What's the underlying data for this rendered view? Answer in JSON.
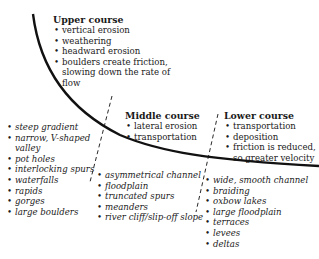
{
  "diagram": {
    "upper_course": {
      "title": "Upper course",
      "processes": [
        "vertical erosion",
        "weathering",
        "headward erosion",
        "boulders create friction, slowing down the rate of flow"
      ],
      "features": [
        "steep gradient",
        "narrow, V-shaped valley",
        "pot holes",
        "interlocking spurs",
        "waterfalls",
        "rapids",
        "gorges",
        "large boulders"
      ]
    },
    "middle_course": {
      "title": "Middle course",
      "processes": [
        "lateral erosion",
        "transportation"
      ],
      "features": [
        "asymmetrical channel",
        "floodplain",
        "truncated spurs",
        "meanders",
        "river cliff/slip-off slope"
      ]
    },
    "lower_course": {
      "title": "Lower course",
      "processes": [
        "transportation",
        "deposition",
        "friction is reduced, so greater velocity"
      ],
      "features": [
        "wide, smooth channel",
        "braiding",
        "oxbow lakes",
        "large floodplain",
        "terraces",
        "levees",
        "deltas"
      ]
    },
    "colors": {
      "line": "#111111",
      "text": "#1a1a1a",
      "background": "#ffffff"
    }
  }
}
